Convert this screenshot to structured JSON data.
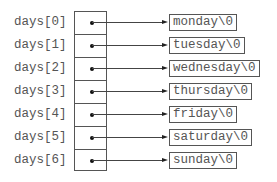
{
  "diagram": {
    "type": "pointer-array-to-strings",
    "array_name": "days",
    "rows": [
      {
        "index_label": "days[0]",
        "string": "monday\\0"
      },
      {
        "index_label": "days[1]",
        "string": "tuesday\\0"
      },
      {
        "index_label": "days[2]",
        "string": "wednesday\\0"
      },
      {
        "index_label": "days[3]",
        "string": "thursday\\0"
      },
      {
        "index_label": "days[4]",
        "string": "friday\\0"
      },
      {
        "index_label": "days[5]",
        "string": "saturday\\0"
      },
      {
        "index_label": "days[6]",
        "string": "sunday\\0"
      }
    ]
  },
  "colors": {
    "text": "#555555",
    "lines": "#444444",
    "dots": "#111111",
    "background": "#ffffff"
  }
}
